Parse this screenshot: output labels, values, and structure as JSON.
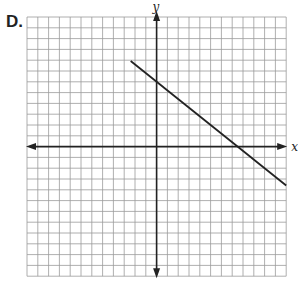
{
  "option_label": "D.",
  "axes": {
    "x_label": "x",
    "y_label": "y"
  },
  "grid": {
    "cells_x": 24,
    "cells_y": 24,
    "x_range": [
      -12,
      12
    ],
    "y_range": [
      -12,
      12
    ],
    "line_color": "#9a9a9a",
    "axis_color": "#222222"
  },
  "chart_data": {
    "type": "line",
    "title": "",
    "xlabel": "x",
    "ylabel": "y",
    "xlim": [
      -12,
      12
    ],
    "ylim": [
      -12,
      12
    ],
    "grid": true,
    "series": [
      {
        "name": "line",
        "equation": "y = -4/5 x + 6",
        "slope": -0.8,
        "y_intercept": 6,
        "x_intercept": 7.5,
        "x": [
          -2.4,
          12
        ],
        "y": [
          7.92,
          -3.6
        ],
        "color": "#222222"
      }
    ]
  }
}
